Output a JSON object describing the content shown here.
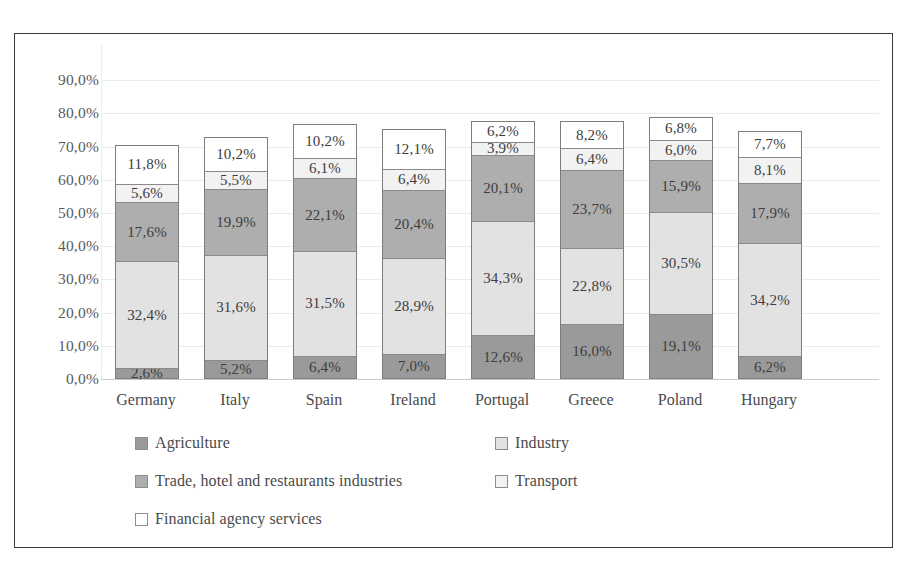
{
  "chart_data": {
    "type": "bar",
    "stacked": true,
    "title": "",
    "subtitle": "",
    "xlabel": "",
    "ylabel": "",
    "ylim": [
      0,
      90
    ],
    "ytick_labels": [
      "90,0%",
      "80,0%",
      "70,0%",
      "60,0%",
      "50,0%",
      "40,0%",
      "30,0%",
      "20,0%",
      "10,0%",
      "0,0%"
    ],
    "ytick_values": [
      90,
      80,
      70,
      60,
      50,
      40,
      30,
      20,
      10,
      0
    ],
    "grid": true,
    "legend_position": "bottom",
    "categories": [
      "Germany",
      "Italy",
      "Spain",
      "Ireland",
      "Portugal",
      "Greece",
      "Poland",
      "Hungary"
    ],
    "series": [
      {
        "name": "Agriculture",
        "key": "agriculture",
        "color": "#9a9a9a",
        "values": [
          2.6,
          5.2,
          6.4,
          7.0,
          12.6,
          16.0,
          19.1,
          6.2
        ],
        "labels": [
          "2,6%",
          "5,2%",
          "6,4%",
          "7,0%",
          "12,6%",
          "16,0%",
          "19,1%",
          "6,2%"
        ]
      },
      {
        "name": "Industry",
        "key": "industry",
        "color": "#e2e2e2",
        "values": [
          32.4,
          31.6,
          31.5,
          28.9,
          34.3,
          22.8,
          30.5,
          34.2
        ],
        "labels": [
          "32,4%",
          "31,6%",
          "31,5%",
          "28,9%",
          "34,3%",
          "22,8%",
          "30,5%",
          "34,2%"
        ]
      },
      {
        "name": "Trade, hotel and restaurants industries",
        "key": "trade",
        "color": "#aeaeae",
        "values": [
          17.6,
          19.9,
          22.1,
          20.4,
          20.1,
          23.7,
          15.9,
          17.9
        ],
        "labels": [
          "17,6%",
          "19,9%",
          "22,1%",
          "20,4%",
          "20,1%",
          "23,7%",
          "15,9%",
          "17,9%"
        ]
      },
      {
        "name": "Transport",
        "key": "transport",
        "color": "#f2f2f2",
        "values": [
          5.6,
          5.5,
          6.1,
          6.4,
          3.9,
          6.4,
          6.0,
          8.1
        ],
        "labels": [
          "5,6%",
          "5,5%",
          "6,1%",
          "6,4%",
          "3,9%",
          "6,4%",
          "6,0%",
          "8,1%"
        ]
      },
      {
        "name": "Financial agency services",
        "key": "financial",
        "color": "#ffffff",
        "values": [
          11.8,
          10.2,
          10.2,
          12.1,
          6.2,
          8.2,
          6.8,
          7.7
        ],
        "labels": [
          "11,8%",
          "10,2%",
          "10,2%",
          "12,1%",
          "6,2%",
          "8,2%",
          "6,8%",
          "7,7%"
        ]
      }
    ]
  },
  "legend": {
    "rows": [
      [
        {
          "label": "Agriculture",
          "color": "#9a9a9a"
        },
        {
          "label": "Industry",
          "color": "#e2e2e2"
        }
      ],
      [
        {
          "label": "Trade, hotel and restaurants industries",
          "color": "#aeaeae"
        },
        {
          "label": "Transport",
          "color": "#f2f2f2"
        }
      ],
      [
        {
          "label": "Financial agency services",
          "color": "#ffffff"
        }
      ]
    ]
  },
  "colors": {
    "agriculture": "#9a9a9a",
    "industry": "#e2e2e2",
    "trade": "#aeaeae",
    "transport": "#f2f2f2",
    "financial": "#ffffff",
    "frame": "#3c3c3c",
    "text": "#4a4a4a"
  }
}
